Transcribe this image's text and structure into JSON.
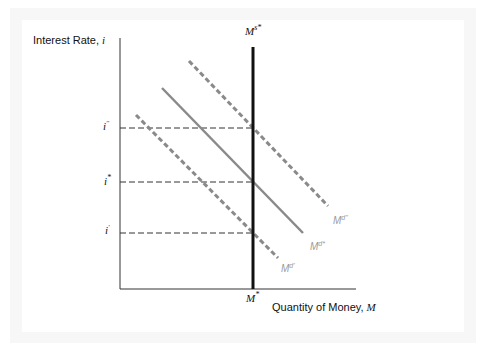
{
  "diagram": {
    "y_axis_label": "Interest Rate, ",
    "y_axis_var": "i",
    "x_axis_label": "Quantity of Money, ",
    "x_axis_var": "M",
    "supply_label": "M",
    "supply_sup": "s*",
    "equilibrium_quantity_label": "M",
    "equilibrium_quantity_sup": "*",
    "rate_labels": [
      {
        "base": "i",
        "sup": "''",
        "name": "i-double-prime"
      },
      {
        "base": "i",
        "sup": "*",
        "name": "i-star"
      },
      {
        "base": "i",
        "sup": "'",
        "name": "i-prime"
      }
    ],
    "demand_curves": [
      {
        "base": "M",
        "sup": "d''",
        "style": "dashed",
        "name": "money-demand-high"
      },
      {
        "base": "M",
        "sup": "d*",
        "style": "solid",
        "name": "money-demand-equilibrium"
      },
      {
        "base": "M",
        "sup": "d'",
        "style": "dashed",
        "name": "money-demand-low"
      }
    ],
    "colors": {
      "supply": "#111111",
      "demand": "#8a8a8a",
      "axes": "#222222",
      "guide": "#333333",
      "frame": "#f7f7f7"
    }
  }
}
